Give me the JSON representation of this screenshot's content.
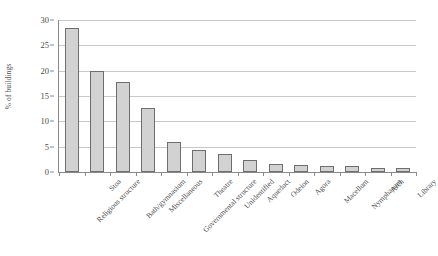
{
  "chart_data": {
    "type": "bar",
    "title": "",
    "xlabel": "",
    "ylabel": "% of buildings",
    "ylim": [
      0,
      30
    ],
    "yticks": [
      0,
      5,
      10,
      15,
      20,
      25,
      30
    ],
    "grid": true,
    "legend": "none",
    "categories": [
      "Religious structure",
      "Stoa",
      "Bath/gymnasium",
      "Miscellaneous",
      "Governmental structure",
      "Theatre",
      "Unidentified",
      "Aqueduct",
      "Odeion",
      "Agora",
      "Macellum",
      "Nymphaeum",
      "Arch",
      "Library"
    ],
    "values": [
      28.5,
      20.0,
      17.7,
      12.7,
      6.0,
      4.3,
      3.6,
      2.3,
      1.6,
      1.3,
      1.2,
      1.2,
      0.7,
      0.7
    ],
    "bar_fill_color": "#d2d2d2",
    "bar_edge_color": "#6e6e6e",
    "gridline_color": "#c8c8c8",
    "axis_color": "#8a8a8a"
  }
}
